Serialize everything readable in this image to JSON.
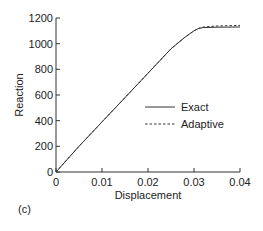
{
  "panel_label": "(c)",
  "chart_data": {
    "type": "line",
    "title": "",
    "xlabel": "Displacement",
    "ylabel": "Reaction",
    "xlim": [
      0,
      0.04
    ],
    "ylim": [
      0,
      1200
    ],
    "xticks": [
      0,
      0.01,
      0.02,
      0.03,
      0.04
    ],
    "xtick_labels": [
      "0",
      "0.01",
      "0.02",
      "0.03",
      "0.04"
    ],
    "yticks": [
      0,
      200,
      400,
      600,
      800,
      1000,
      1200
    ],
    "ytick_labels": [
      "0",
      "200",
      "400",
      "600",
      "800",
      "1000",
      "1200"
    ],
    "grid": false,
    "legend_position": "center-right",
    "series": [
      {
        "name": "Exact",
        "style": "solid",
        "x": [
          0,
          0.005,
          0.01,
          0.015,
          0.02,
          0.025,
          0.028,
          0.03,
          0.031,
          0.032,
          0.035,
          0.04
        ],
        "y": [
          0,
          200,
          390,
          580,
          770,
          960,
          1050,
          1100,
          1118,
          1125,
          1128,
          1130
        ]
      },
      {
        "name": "Adaptive",
        "style": "dashed",
        "x": [
          0,
          0.005,
          0.01,
          0.015,
          0.02,
          0.025,
          0.028,
          0.03,
          0.031,
          0.032,
          0.035,
          0.04
        ],
        "y": [
          0,
          200,
          390,
          580,
          770,
          960,
          1050,
          1100,
          1120,
          1130,
          1138,
          1142
        ]
      }
    ]
  }
}
